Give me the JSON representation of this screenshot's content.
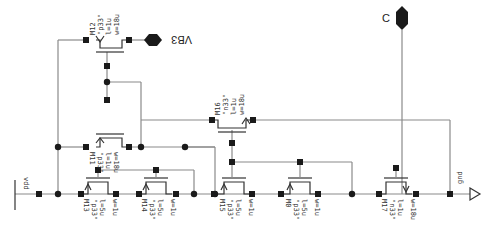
{
  "schematic": {
    "pins": {
      "vb3": {
        "label": "VB3"
      },
      "c": {
        "label": "C"
      },
      "vdd": {
        "label": "vdd"
      },
      "gnd": {
        "label": "gnd"
      }
    },
    "transistors": [
      {
        "name": "M12",
        "model": "\"p33\"",
        "l": "l=1u",
        "w": "w=18u"
      },
      {
        "name": "M11",
        "model": "\"p33\"",
        "l": "l=1u",
        "w": "w=18u"
      },
      {
        "name": "M16",
        "model": "\"n33\"",
        "l": "l=1u",
        "w": "w=18u"
      },
      {
        "name": "M13",
        "model": "\"p33\"",
        "l": "l=5u",
        "w": "w=1u"
      },
      {
        "name": "M14",
        "model": "\"p33\"",
        "l": "l=5u",
        "w": "w=1u"
      },
      {
        "name": "M15",
        "model": "\"p33\"",
        "l": "l=5u",
        "w": "w=1u"
      },
      {
        "name": "M0",
        "model": "\"p33\"",
        "l": "l=5u",
        "w": "w=1u"
      },
      {
        "name": "M17",
        "model": "\"n33\"",
        "l": "l=1u",
        "w": "w=18u"
      }
    ]
  }
}
